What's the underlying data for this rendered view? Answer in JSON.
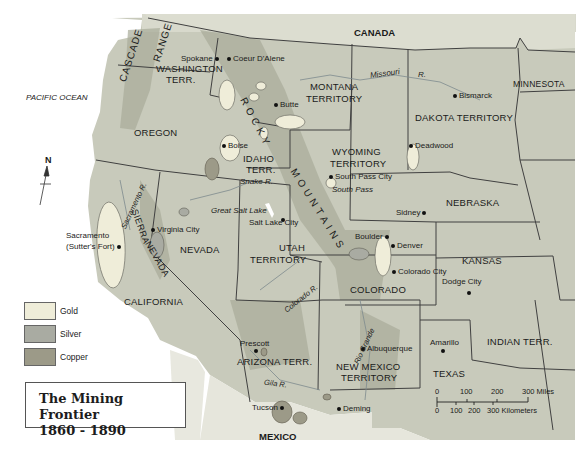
{
  "map": {
    "title_line1": "The Mining Frontier",
    "title_line2": "1860 - 1890",
    "colors": {
      "background": "#ffffff",
      "land": "#c8cabb",
      "mountain_shading": "#a7aa98",
      "gold": "#efedd9",
      "silver": "#a9aba2",
      "copper": "#9c9a88",
      "border": "#3c3c3c"
    },
    "legend": [
      {
        "label": "Gold",
        "color": "#efedd9"
      },
      {
        "label": "Silver",
        "color": "#a9aba2"
      },
      {
        "label": "Copper",
        "color": "#9c9a88"
      }
    ],
    "north_arrow": "N",
    "water_labels": {
      "pacific": "PACIFIC OCEAN",
      "missouri": "Missouri",
      "missouri_r": "R.",
      "snake": "Snake R.",
      "great_salt_lake": "Great Salt Lake",
      "sacramento_r": "Sacramento R.",
      "colorado_r": "Colorado R.",
      "rio_grande": "Rio Grande",
      "gila": "Gila R."
    },
    "countries": {
      "canada": "CANADA",
      "mexico": "MEXICO"
    },
    "ranges": {
      "cascade": "CASCADE",
      "range": "RANGE",
      "rocky": "ROCKY",
      "mountains": "MOUNTAINS",
      "sierra": "SIERRA",
      "nevada_range": "NEVADA"
    },
    "regions": {
      "washington_1": "WASHINGTON",
      "washington_2": "TERR.",
      "oregon": "OREGON",
      "idaho_1": "IDAHO",
      "idaho_2": "TERR.",
      "montana_1": "MONTANA",
      "montana_2": "TERRITORY",
      "dakota": "DAKOTA TERRITORY",
      "minnesota": "MINNESOTA",
      "wyoming_1": "WYOMING",
      "wyoming_2": "TERRITORY",
      "nebraska": "NEBRASKA",
      "nevada": "NEVADA",
      "utah_1": "UTAH",
      "utah_2": "TERRITORY",
      "colorado": "COLORADO",
      "kansas": "KANSAS",
      "california": "CALIFORNIA",
      "arizona": "ARIZONA TERR.",
      "new_mexico_1": "NEW MEXICO",
      "new_mexico_2": "TERRITORY",
      "texas": "TEXAS",
      "indian": "INDIAN TERR."
    },
    "cities": {
      "spokane": "Spokane",
      "coeur": "Coeur D'Alene",
      "butte": "Butte",
      "bismarck": "Bismarck",
      "deadwood": "Deadwood",
      "boise": "Boise",
      "south_pass_city": "South Pass City",
      "south_pass": "South Pass",
      "sidney": "Sidney",
      "salt_lake_city": "Salt Lake City",
      "virginia_city": "Virginia City",
      "sacramento_1": "Sacramento",
      "sacramento_2": "(Sutter's Fort)",
      "boulder": "Boulder",
      "denver": "Denver",
      "colorado_city": "Colorado City",
      "dodge_city": "Dodge City",
      "prescott": "Prescott",
      "albuquerque": "Albuquerque",
      "amarillo": "Amarillo",
      "tucson": "Tucson",
      "deming": "Deming"
    },
    "scale": {
      "miles": [
        "0",
        "100",
        "200",
        "300 Miles"
      ],
      "km": [
        "0",
        "100",
        "200",
        "300 Kilometers"
      ]
    }
  }
}
